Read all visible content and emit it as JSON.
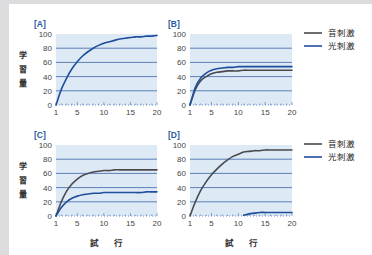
{
  "colors": {
    "sound": "#4a4a4e",
    "light": "#1f4e9c",
    "plot_bg": "#dde9f5",
    "grid": "#3a64a8",
    "background": "#dcdcde"
  },
  "legend": {
    "sound_label": "音刺激",
    "light_label": "光刺激"
  },
  "axis": {
    "ylabel": [
      "学",
      "習",
      "量"
    ],
    "xlabel": [
      "試",
      "行"
    ],
    "yticks": [
      "0",
      "20",
      "40",
      "60",
      "80",
      "100"
    ],
    "xticks": [
      "1",
      "5",
      "10",
      "15",
      "20"
    ]
  },
  "chart_data": [
    {
      "type": "line",
      "title": "[A]",
      "xlabel": "",
      "ylabel": "学習量",
      "xlim": [
        1,
        20
      ],
      "ylim": [
        0,
        100
      ],
      "grid": true,
      "x": [
        1,
        2,
        3,
        4,
        5,
        6,
        7,
        8,
        9,
        10,
        11,
        12,
        13,
        14,
        15,
        16,
        17,
        18,
        19,
        20
      ],
      "series": [
        {
          "name": "combined",
          "values": [
            0,
            22,
            38,
            51,
            61,
            69,
            75,
            80,
            84,
            87,
            89,
            91,
            93,
            94,
            95,
            96,
            96,
            97,
            97,
            98
          ]
        }
      ]
    },
    {
      "type": "line",
      "title": "[B]",
      "xlabel": "",
      "ylabel": "",
      "xlim": [
        1,
        20
      ],
      "ylim": [
        0,
        100
      ],
      "grid": true,
      "legend_position": "right",
      "x": [
        1,
        2,
        3,
        4,
        5,
        6,
        7,
        8,
        9,
        10,
        11,
        12,
        13,
        14,
        15,
        16,
        17,
        18,
        19,
        20
      ],
      "series": [
        {
          "name": "音刺激",
          "values": [
            0,
            22,
            34,
            40,
            44,
            46,
            47,
            48,
            48,
            48,
            49,
            49,
            49,
            49,
            49,
            49,
            49,
            49,
            49,
            49
          ]
        },
        {
          "name": "光刺激",
          "values": [
            0,
            25,
            38,
            45,
            49,
            51,
            52,
            53,
            53,
            54,
            54,
            54,
            54,
            54,
            54,
            54,
            54,
            54,
            54,
            54
          ]
        }
      ]
    },
    {
      "type": "line",
      "title": "[C]",
      "xlabel": "試行",
      "ylabel": "学習量",
      "xlim": [
        1,
        20
      ],
      "ylim": [
        0,
        100
      ],
      "grid": true,
      "x": [
        1,
        2,
        3,
        4,
        5,
        6,
        7,
        8,
        9,
        10,
        11,
        12,
        13,
        14,
        15,
        16,
        17,
        18,
        19,
        20
      ],
      "series": [
        {
          "name": "音刺激",
          "values": [
            0,
            20,
            35,
            45,
            52,
            57,
            60,
            62,
            63,
            64,
            64,
            65,
            65,
            65,
            65,
            65,
            65,
            65,
            65,
            65
          ]
        },
        {
          "name": "光刺激",
          "values": [
            0,
            12,
            20,
            25,
            28,
            30,
            31,
            32,
            32,
            33,
            33,
            33,
            33,
            33,
            33,
            33,
            33,
            34,
            34,
            34
          ]
        }
      ]
    },
    {
      "type": "line",
      "title": "[D]",
      "xlabel": "試行",
      "ylabel": "",
      "xlim": [
        1,
        20
      ],
      "ylim": [
        0,
        100
      ],
      "grid": true,
      "legend_position": "right",
      "x": [
        1,
        2,
        3,
        4,
        5,
        6,
        7,
        8,
        9,
        10,
        11,
        12,
        13,
        14,
        15,
        16,
        17,
        18,
        19,
        20
      ],
      "series": [
        {
          "name": "音刺激",
          "values": [
            0,
            20,
            36,
            48,
            58,
            66,
            73,
            79,
            84,
            87,
            90,
            91,
            92,
            92,
            93,
            93,
            93,
            93,
            93,
            93
          ]
        },
        {
          "name": "光刺激",
          "values": [
            null,
            null,
            null,
            null,
            null,
            null,
            null,
            null,
            null,
            null,
            1,
            3,
            4,
            5,
            5,
            5,
            5,
            5,
            5,
            5
          ]
        }
      ]
    }
  ]
}
